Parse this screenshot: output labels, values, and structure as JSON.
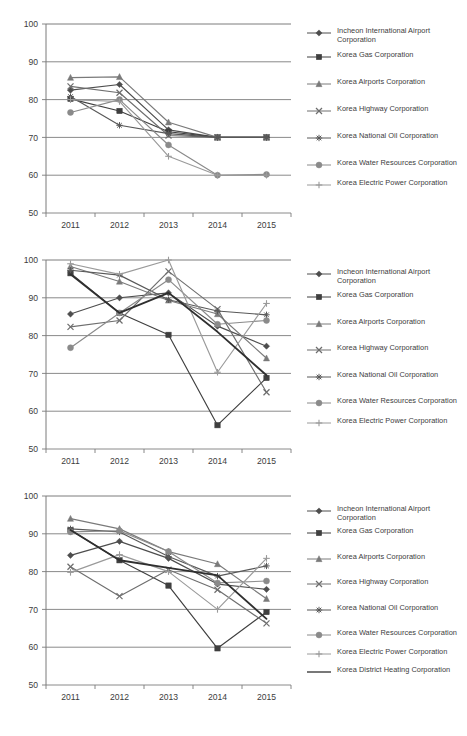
{
  "page": {
    "background": "#ffffff",
    "line_color": "#6b6b6b",
    "axis_color": "#7a7a7a",
    "text_color": "#3c3c3c",
    "width": 467,
    "height": 736
  },
  "legend_markers": {
    "Incheon International Airport Corporation": "diamond",
    "Korea Gas Corporation": "square",
    "Korea Airports Corporation": "triangle",
    "Korea Highway Corporation": "x-cross",
    "Korea National Oil Corporation": "star",
    "Korea Water Resources Corporation": "circle",
    "Korea Electric Power Corporation": "plus",
    "Korea District Heating Corporation": "none"
  },
  "charts": [
    {
      "id": "chart-1",
      "chart_data": {
        "type": "line",
        "title": "",
        "xlabel": "",
        "ylabel": "",
        "grid": true,
        "legend_position": "right",
        "ylim": [
          50,
          100
        ],
        "yticks": [
          50,
          60,
          70,
          80,
          90,
          100
        ],
        "categories": [
          "2011",
          "2012",
          "2013",
          "2014",
          "2015"
        ],
        "series": [
          {
            "name": "Incheon International Airport Corporation",
            "marker": "diamond",
            "color": "#4d4d4d",
            "values": [
              82.5,
              84.0,
              72.0,
              70.0,
              70.0
            ]
          },
          {
            "name": "Korea Gas Corporation",
            "marker": "square",
            "color": "#3f3f3f",
            "values": [
              80.2,
              77.0,
              71.5,
              70.0,
              70.0
            ]
          },
          {
            "name": "Korea Airports Corporation",
            "marker": "triangle",
            "color": "#7a7a7a",
            "values": [
              85.8,
              86.0,
              74.0,
              70.0,
              70.0
            ]
          },
          {
            "name": "Korea Highway Corporation",
            "marker": "x-cross",
            "color": "#6e6e6e",
            "values": [
              83.5,
              81.8,
              70.5,
              70.0,
              70.0
            ]
          },
          {
            "name": "Korea National Oil Corporation",
            "marker": "star",
            "color": "#585858",
            "values": [
              80.8,
              73.2,
              71.0,
              70.0,
              70.0
            ]
          },
          {
            "name": "Korea Water Resources Corporation",
            "marker": "circle",
            "color": "#8a8a8a",
            "values": [
              76.6,
              80.0,
              68.0,
              60.0,
              60.2
            ]
          },
          {
            "name": "Korea Electric Power Corporation",
            "marker": "plus",
            "color": "#9a9a9a",
            "values": [
              80.0,
              79.5,
              65.0,
              60.0,
              60.0
            ]
          }
        ]
      },
      "legend": [
        "Incheon International Airport Corporation",
        "Korea Gas Corporation",
        "Korea Airports Corporation",
        "Korea Highway Corporation",
        "Korea National Oil Corporation",
        "Korea Water Resources Corporation",
        "Korea Electric Power Corporation"
      ]
    },
    {
      "id": "chart-2",
      "chart_data": {
        "type": "line",
        "title": "",
        "xlabel": "",
        "ylabel": "",
        "grid": true,
        "legend_position": "right",
        "ylim": [
          50,
          100
        ],
        "yticks": [
          50,
          60,
          70,
          80,
          90,
          100
        ],
        "categories": [
          "2011",
          "2012",
          "2013",
          "2014",
          "2015"
        ],
        "series": [
          {
            "name": "Incheon International Airport Corporation",
            "marker": "diamond",
            "color": "#4d4d4d",
            "values": [
              85.7,
              90.0,
              91.3,
              82.5,
              77.2
            ]
          },
          {
            "name": "Korea Gas Corporation",
            "marker": "square",
            "color": "#3f3f3f",
            "values": [
              96.5,
              86.0,
              80.2,
              56.3,
              68.8
            ]
          },
          {
            "name": "Korea Airports Corporation",
            "marker": "triangle",
            "color": "#7a7a7a",
            "values": [
              98.3,
              94.3,
              89.3,
              85.7,
              74.0
            ]
          },
          {
            "name": "Korea Highway Corporation",
            "marker": "x-cross",
            "color": "#6e6e6e",
            "values": [
              82.3,
              84.0,
              97.0,
              87.0,
              65.0
            ]
          },
          {
            "name": "Korea National Oil Corporation",
            "marker": "star",
            "color": "#585858",
            "values": [
              97.3,
              96.0,
              89.5,
              86.5,
              85.5
            ]
          },
          {
            "name": "Korea Water Resources Corporation",
            "marker": "circle",
            "color": "#8a8a8a",
            "values": [
              76.8,
              86.0,
              94.8,
              83.0,
              84.0
            ]
          },
          {
            "name": "Korea Electric Power Corporation",
            "marker": "plus",
            "color": "#9a9a9a",
            "values": [
              99.0,
              96.2,
              100.0,
              70.3,
              88.5
            ]
          },
          {
            "name": "Korea District Heating Corporation",
            "marker": "none",
            "color": "#2f2f2f",
            "values": [
              96.2,
              86.0,
              91.3,
              81.0,
              69.5
            ]
          }
        ]
      },
      "legend": [
        "Incheon International Airport Corporation",
        "Korea Gas Corporation",
        "Korea Airports Corporation",
        "Korea Highway Corporation",
        "Korea National Oil Corporation",
        "Korea Water Resources Corporation",
        "Korea Electric Power Corporation"
      ]
    },
    {
      "id": "chart-3",
      "chart_data": {
        "type": "line",
        "title": "",
        "xlabel": "",
        "ylabel": "",
        "grid": true,
        "legend_position": "right",
        "ylim": [
          50,
          100
        ],
        "yticks": [
          50,
          60,
          70,
          80,
          90,
          100
        ],
        "categories": [
          "2011",
          "2012",
          "2013",
          "2014",
          "2015"
        ],
        "series": [
          {
            "name": "Incheon International Airport Corporation",
            "marker": "diamond",
            "color": "#4d4d4d",
            "values": [
              84.3,
              88.0,
              83.5,
              76.7,
              75.3
            ]
          },
          {
            "name": "Korea Gas Corporation",
            "marker": "square",
            "color": "#3f3f3f",
            "values": [
              91.0,
              83.0,
              76.3,
              59.7,
              69.3
            ]
          },
          {
            "name": "Korea Airports Corporation",
            "marker": "triangle",
            "color": "#7a7a7a",
            "values": [
              94.0,
              91.3,
              85.3,
              82.0,
              72.8
            ]
          },
          {
            "name": "Korea Highway Corporation",
            "marker": "x-cross",
            "color": "#6e6e6e",
            "values": [
              81.3,
              73.5,
              80.5,
              75.2,
              66.3
            ]
          },
          {
            "name": "Korea National Oil Corporation",
            "marker": "star",
            "color": "#585858",
            "values": [
              91.3,
              90.5,
              84.0,
              78.8,
              81.5
            ]
          },
          {
            "name": "Korea Water Resources Corporation",
            "marker": "circle",
            "color": "#8a8a8a",
            "values": [
              90.5,
              90.8,
              85.3,
              77.0,
              77.5
            ]
          },
          {
            "name": "Korea Electric Power Corporation",
            "marker": "plus",
            "color": "#9a9a9a",
            "values": [
              79.8,
              84.5,
              80.0,
              70.0,
              83.5
            ]
          },
          {
            "name": "Korea District Heating Corporation",
            "marker": "none",
            "color": "#2f2f2f",
            "values": [
              91.0,
              83.0,
              81.0,
              79.0,
              67.5
            ]
          }
        ]
      },
      "legend": [
        "Incheon International Airport Corporation",
        "Korea Gas Corporation",
        "Korea Airports Corporation",
        "Korea Highway Corporation",
        "Korea National Oil Corporation",
        "Korea Water Resources Corporation",
        "Korea Electric Power Corporation",
        "Korea District Heating Corporation"
      ]
    }
  ]
}
